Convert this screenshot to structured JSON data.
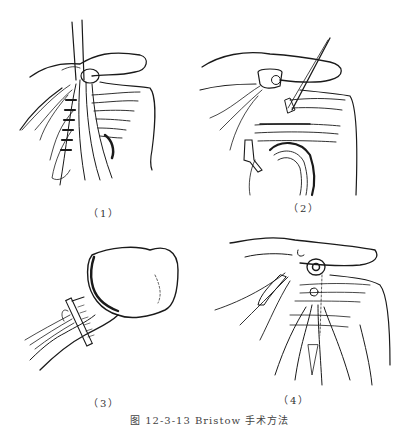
{
  "figure": {
    "caption": "图 12-3-13  Bristow 手术方法",
    "panels": [
      {
        "id": 1,
        "label": "（1）",
        "description": "Coracoid process osteotomy with attached tendon, retractor lifting conjoined tendon over subscapularis"
      },
      {
        "id": 2,
        "label": "（2）",
        "description": "Coracoid fragment with screw, drill guide passing through split subscapularis to scapular neck"
      },
      {
        "id": 3,
        "label": "（3）",
        "description": "Humeral head view with clamp on tendon"
      },
      {
        "id": 4,
        "label": "（4）",
        "description": "Coracoid fragment fixed with screw to glenoid neck, subscapularis repaired"
      }
    ]
  },
  "colors": {
    "ink": "#1a1a1a",
    "background": "#ffffff"
  }
}
